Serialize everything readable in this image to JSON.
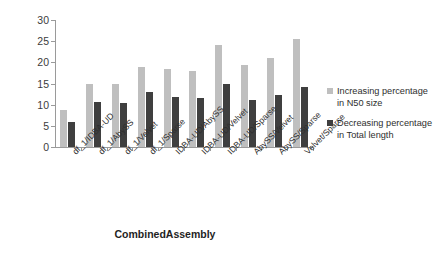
{
  "chart_data": {
    "type": "bar",
    "title": "",
    "xlabel": "CombinedAssembly",
    "ylabel": "",
    "ylim": [
      0,
      30
    ],
    "yticks": [
      0,
      5,
      10,
      15,
      20,
      25,
      30
    ],
    "grid": false,
    "legend_position": "right",
    "categories": [
      "df_1/IDBA-UD",
      "df_1/AbySS",
      "df_1/Velvet",
      "df_1/Sparse",
      "IDBA-UD/AbySS",
      "IDBA-UD/Velvet",
      "IDBA-UD/Sparse",
      "AbySS/Velvet",
      "AbySS/Sparse",
      "Velvet/Sparse"
    ],
    "series": [
      {
        "name": "Increasing percentage in N50 size",
        "color": "#bfbfbf",
        "values": [
          8.7,
          15.0,
          14.8,
          19.0,
          18.5,
          17.9,
          24.0,
          19.4,
          21.0,
          25.6
        ]
      },
      {
        "name": "Decreasing percentage in Total length",
        "color": "#3f3f3f",
        "values": [
          6.0,
          10.6,
          10.5,
          13.0,
          11.9,
          11.5,
          15.0,
          11.0,
          12.2,
          14.2
        ]
      }
    ]
  },
  "axis": {
    "y_tick_labels": [
      "0",
      "5",
      "10",
      "15",
      "20",
      "25",
      "30"
    ],
    "x_axis_title": "CombinedAssembly"
  },
  "legend": {
    "items": [
      {
        "label_line1": "Increasing percentage",
        "label_line2": "in N50 size"
      },
      {
        "label_line1": "Decreasing percentage",
        "label_line2": "in Total length"
      }
    ]
  }
}
